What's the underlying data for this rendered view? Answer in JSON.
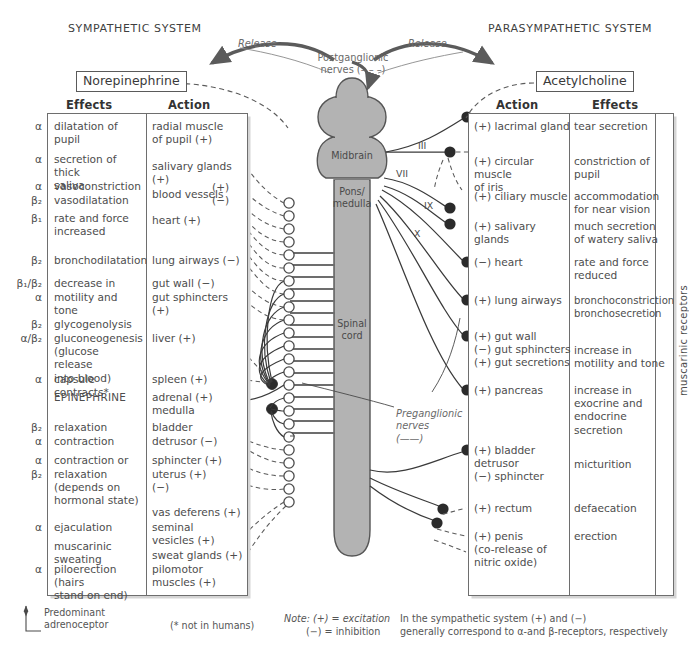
{
  "titles": {
    "sympathetic": "SYMPATHETIC SYSTEM",
    "parasympathetic": "PARASYMPATHETIC SYSTEM"
  },
  "transmitters": {
    "sympathetic": "Norepinephrine",
    "parasympathetic": "Acetylcholine"
  },
  "arrows": {
    "release_left": "Release",
    "release_right": "Release",
    "postganglionic": "Postganglionic\nnerves (– – –)",
    "preganglionic": "Preganglionic\nnerves\n(——)"
  },
  "cns": {
    "midbrain": "Midbrain",
    "pons_medulla": "Pons/\nmedulla",
    "spinal_cord": "Spinal\ncord",
    "cranial_nerves": [
      "III",
      "VII",
      "IX",
      "X"
    ]
  },
  "sympathetic_table": {
    "headers": {
      "effects": "Effects",
      "action": "Action"
    },
    "rows": [
      {
        "receptor": "α",
        "effect": "dilatation of pupil",
        "action": "  radial muscle\nof pupil (+)"
      },
      {
        "receptor": "α",
        "effect": "secretion of thick\nsaliva",
        "action": "salivary glands (+)"
      },
      {
        "receptor": "α",
        "effect": "vasoconstriction",
        "action": "blood vessels"
      },
      {
        "receptor": "β₂",
        "effect": "vasodilatation",
        "action": "(+)\n(−)"
      },
      {
        "receptor": "β₁",
        "effect": "rate and force\nincreased",
        "action": "heart (+)"
      },
      {
        "receptor": "β₂",
        "effect": "bronchodilatation",
        "action": "lung airways (−)"
      },
      {
        "receptor": "β₁/β₂",
        "effect": "decrease in",
        "action": "gut wall (−)"
      },
      {
        "receptor": "α",
        "effect": "motility and tone",
        "action": "gut sphincters (+)"
      },
      {
        "receptor": "β₂",
        "effect": "glycogenolysis",
        "action": ""
      },
      {
        "receptor": "α/β₂",
        "effect": "gluconeogenesis\n(glucose release\ninto blood)",
        "action": "liver (+)"
      },
      {
        "receptor": "α",
        "effect": "capsule contracts*",
        "action": "spleen (+)"
      },
      {
        "receptor": "",
        "effect": "EPINEPHRINE",
        "action": "adrenal (+)\nmedulla"
      },
      {
        "receptor": "β₂",
        "effect": "relaxation",
        "action": "bladder"
      },
      {
        "receptor": "α",
        "effect": "contraction",
        "action": "detrusor (−)"
      },
      {
        "receptor": "α",
        "effect": "contraction or",
        "action": "sphincter (+)"
      },
      {
        "receptor": "β₂",
        "effect": "relaxation\n(depends on\nhormonal state)",
        "action": "uterus (+)\n        (−)"
      },
      {
        "receptor": "",
        "effect": "",
        "action": "vas deferens (+)"
      },
      {
        "receptor": "α",
        "effect": "ejaculation",
        "action": "seminal\nvesicles (+)"
      },
      {
        "receptor": "",
        "effect": "muscarinic\nsweating",
        "action": "sweat glands (+)"
      },
      {
        "receptor": "α",
        "effect": "piloerection (hairs\nstand on end)",
        "action": "pilomotor\nmuscles (+)"
      }
    ]
  },
  "parasympathetic_table": {
    "headers": {
      "action": "Action",
      "effects": "Effects"
    },
    "rows": [
      {
        "action": "(+) lacrimal gland",
        "effect": "tear secretion"
      },
      {
        "action": "(+) circular muscle\n        of iris",
        "effect": "constriction of\npupil"
      },
      {
        "action": "(+) ciliary muscle",
        "effect": "accommodation\nfor near vision"
      },
      {
        "action": "(+) salivary glands",
        "effect": "much secretion\nof watery saliva"
      },
      {
        "action": "(−) heart",
        "effect": "rate and force\nreduced"
      },
      {
        "action": "(+) lung airways",
        "effect": "bronchoconstriction\nbronchosecretion"
      },
      {
        "action": "(+) gut wall\n(−) gut sphincters\n(+) gut secretions",
        "effect": "increase in\nmotility and tone"
      },
      {
        "action": "(+) pancreas",
        "effect": "increase in\nexocrine and\nendocrine\nsecretion"
      },
      {
        "action": "(+) bladder\n        detrusor\n(−) sphincter",
        "effect": "micturition"
      },
      {
        "action": "(+) rectum",
        "effect": "defaecation"
      },
      {
        "action": "(+) penis\n     (co-release of\n     nitric oxide)",
        "effect": "erection"
      }
    ],
    "side_label": "muscarinic receptors"
  },
  "footnotes": {
    "predominant": "Predominant\nadrenoceptor",
    "not_in_humans": "(* not in humans)",
    "note_excitation": "Note: (+) = excitation",
    "note_inhibition": "(−) = inhibition",
    "note_receptors_1": "In the sympathetic system (+) and (−)",
    "note_receptors_2": "generally correspond to α-and β-receptors, respectively"
  },
  "colors": {
    "cns_fill": "#b3b3b3",
    "cns_stroke": "#555555",
    "nerve_solid": "#3a3a3a",
    "nerve_dashed": "#555555",
    "table_border": "#6e6e6e",
    "text": "#4d4d4d",
    "ganglion_filled": "#2b2b2b"
  }
}
